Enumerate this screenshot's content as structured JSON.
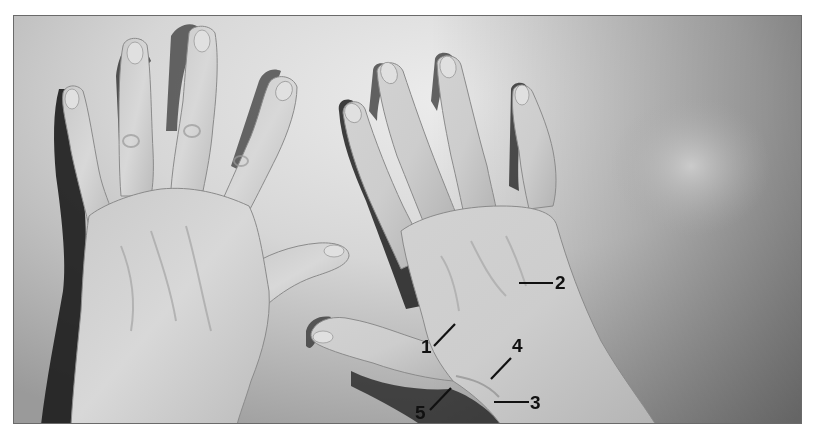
{
  "figure": {
    "type": "anatomical-photograph",
    "colors": {
      "background_light": "#e6e6e6",
      "background_mid": "#bdbdbd",
      "background_dark": "#8f8f8f",
      "skin_light": "#d4d4d4",
      "skin_mid": "#b8b8b8",
      "skin_shadow": "#7a7a7a",
      "cast_shadow": "#1e1e1e",
      "label_ink": "#111111",
      "border": "#6a6a6a"
    },
    "labels": [
      {
        "id": "1",
        "text": "1"
      },
      {
        "id": "2",
        "text": "2"
      },
      {
        "id": "3",
        "text": "3"
      },
      {
        "id": "4",
        "text": "4"
      },
      {
        "id": "5",
        "text": "5"
      }
    ]
  }
}
